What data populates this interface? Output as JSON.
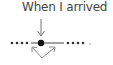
{
  "diagram": {
    "label": "When I arrived",
    "colors": {
      "stroke": "#555555",
      "dot": "#222222",
      "text": "#444444"
    },
    "timeline": {
      "left_dots": 4,
      "right_dots": 4,
      "marker": "current-point"
    }
  }
}
